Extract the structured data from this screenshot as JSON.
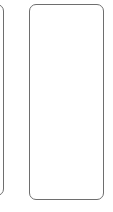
{
  "cards": [
    {
      "id": "previous-card",
      "label": "",
      "partially_visible": true
    },
    {
      "id": "current-card",
      "label": "",
      "partially_visible": false
    }
  ],
  "colors": {
    "border": "#6e6e6e",
    "background": "#ffffff"
  }
}
